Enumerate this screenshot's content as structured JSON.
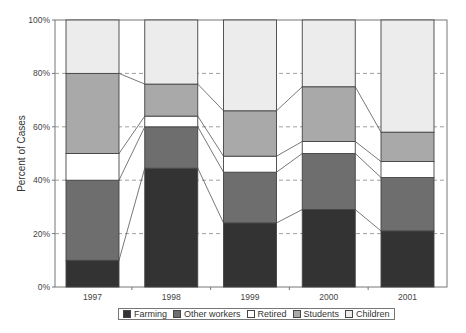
{
  "chart_data": {
    "type": "bar",
    "stacked": true,
    "normalized": true,
    "title": "",
    "xlabel": "",
    "ylabel": "Percent of Cases",
    "ylim": [
      0,
      100
    ],
    "yticks": [
      "0%",
      "20%",
      "40%",
      "60%",
      "80%",
      "100%"
    ],
    "grid": "horizontal dashed",
    "legend_position": "bottom",
    "categories": [
      "1997",
      "1998",
      "1999",
      "2000",
      "2001"
    ],
    "series": [
      {
        "name": "Farming",
        "color": "#333333",
        "values": [
          10,
          44.5,
          24,
          29,
          21
        ]
      },
      {
        "name": "Other workers",
        "color": "#6e6e6e",
        "values": [
          30,
          15.5,
          19,
          21,
          20
        ]
      },
      {
        "name": "Retired",
        "color": "#ffffff",
        "values": [
          10,
          4,
          6,
          4.5,
          6
        ]
      },
      {
        "name": "Students",
        "color": "#a9a9a9",
        "values": [
          30,
          12,
          17,
          20.5,
          11
        ]
      },
      {
        "name": "Children",
        "color": "#ececec",
        "values": [
          20,
          24,
          34,
          25,
          42
        ]
      }
    ]
  },
  "legend": {
    "items": [
      {
        "label": "Farming",
        "color": "#333333"
      },
      {
        "label": "Other workers",
        "color": "#6e6e6e"
      },
      {
        "label": "Retired",
        "color": "#ffffff"
      },
      {
        "label": "Students",
        "color": "#a9a9a9"
      },
      {
        "label": "Children",
        "color": "#ececec"
      }
    ]
  }
}
